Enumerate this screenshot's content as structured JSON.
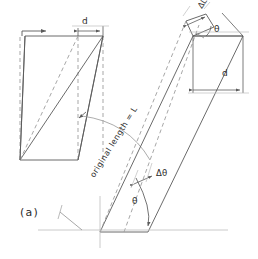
{
  "figure": {
    "caption": "(a)",
    "type": "shear-deformation-diagram",
    "stroke_color": "#5a5a5a",
    "dashed_color": "#9a9a9a",
    "text_color": "#2b2b2b",
    "background": "#ffffff"
  },
  "labels": {
    "displacement_top": "d",
    "displacement_right": "d",
    "delta_length": "ΔL",
    "theta_top": "θ",
    "theta_bottom": "θ",
    "delta_theta": "Δθ",
    "original_length": "original length = L"
  },
  "annotations": {
    "arrow_force_top_left": "force-arrow",
    "arc_rotation": "rotation-arc",
    "dimension_d_top": "horizontal displacement d at the top of the original block",
    "dimension_d_right": "vertical displacement d on the sheared block",
    "dimension_dL": "incremental length change ΔL at the tip",
    "angle_theta": "rotation angle θ from the horizontal reference axis",
    "angle_delta_theta": "incremental angle change Δθ"
  }
}
